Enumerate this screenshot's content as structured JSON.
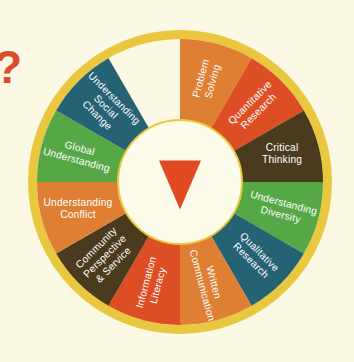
{
  "diagram": {
    "background_color": "#FBF8E4",
    "outer_ring_color": "#E9C83F",
    "inner_circle_color": "#FDFBE9",
    "center_marker": "triangle-pointer",
    "center_marker_color": "#E04A23",
    "decoration": {
      "question_mark": "?",
      "question_mark_color": "#D94F2B"
    },
    "segments": [
      {
        "label": "Problem Solving",
        "lines": [
          "Problem",
          "Solving"
        ],
        "color": "#DE7F33",
        "text_color": "#FFFFFF",
        "mid_angle": 15,
        "orientation": "radial"
      },
      {
        "label": "Quantitative Research",
        "lines": [
          "Quantitative",
          "Research"
        ],
        "color": "#DD4E24",
        "text_color": "#FFFFFF",
        "mid_angle": 45,
        "orientation": "radial"
      },
      {
        "label": "Critical Thinking",
        "lines": [
          "Critical",
          "Thinking"
        ],
        "color": "#4A3A1E",
        "text_color": "#FFFFFF",
        "mid_angle": 75,
        "orientation": "horizontal"
      },
      {
        "label": "Understanding Diversity",
        "lines": [
          "Understanding",
          "Diversity"
        ],
        "color": "#55A845",
        "text_color": "#FFFFFF",
        "mid_angle": 105,
        "orientation": "radial"
      },
      {
        "label": "Qualitative Research",
        "lines": [
          "Qualitative",
          "Research"
        ],
        "color": "#256274",
        "text_color": "#FFFFFF",
        "mid_angle": 135,
        "orientation": "radial"
      },
      {
        "label": "Written Communication",
        "lines": [
          "Written",
          "Communication"
        ],
        "color": "#DE7F33",
        "text_color": "#FFFFFF",
        "mid_angle": 165,
        "orientation": "radial"
      },
      {
        "label": "Information Literacy",
        "lines": [
          "Information",
          "Literacy"
        ],
        "color": "#DD4E24",
        "text_color": "#FFFFFF",
        "mid_angle": 195,
        "orientation": "radial"
      },
      {
        "label": "Community Perspective & Service",
        "lines": [
          "Community",
          "Perspective",
          "& Service"
        ],
        "color": "#4A3A1E",
        "text_color": "#FFFFFF",
        "mid_angle": 225,
        "orientation": "radial"
      },
      {
        "label": "Understanding Conflict",
        "lines": [
          "Understanding",
          "Conflict"
        ],
        "color": "#DE7F33",
        "text_color": "#FFFFFF",
        "mid_angle": 255,
        "orientation": "horizontal"
      },
      {
        "label": "Global Understanding",
        "lines": [
          "Global",
          "Understanding"
        ],
        "color": "#55A845",
        "text_color": "#FFFFFF",
        "mid_angle": 285,
        "orientation": "radial"
      },
      {
        "label": "Understanding Social Change",
        "lines": [
          "Understanding",
          "Social",
          "Change"
        ],
        "color": "#256274",
        "text_color": "#FFFFFF",
        "mid_angle": 315,
        "orientation": "radial"
      },
      {
        "label": "Problem Solving Top",
        "lines": [
          "Problem",
          "Solving"
        ],
        "color": "#DE7F33",
        "text_color": "#FFFFFF",
        "mid_angle": 345,
        "orientation": "radial",
        "hidden": true
      }
    ],
    "geometry": {
      "center_x": 180,
      "center_y": 182,
      "outer_radius": 152,
      "ring_radius": 143,
      "inner_radius": 60,
      "segment_count": 12
    }
  }
}
